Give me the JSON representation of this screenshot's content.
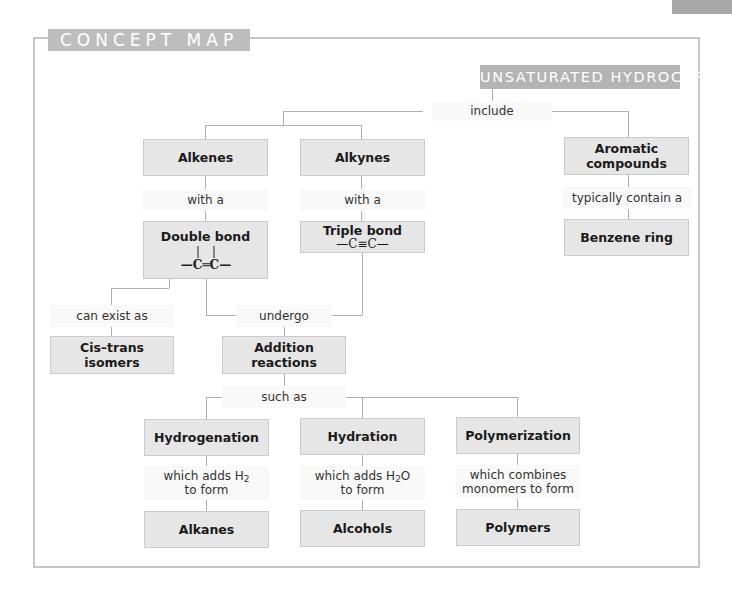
{
  "header": {
    "frame_title": "CONCEPT MAP"
  },
  "root": {
    "label": "UNSATURATED HYDROCARBONS"
  },
  "links": {
    "include": "include",
    "alkenes_with": "with a",
    "alkynes_with": "with a",
    "aromatic_contain": "typically contain a",
    "can_exist_as": "can exist as",
    "undergo": "undergo",
    "such_as": "such as",
    "hydrogenation_adds": "which adds H",
    "hydrogenation_sub": "2",
    "hydrogenation_to_form": "to form",
    "hydration_adds": "which adds H",
    "hydration_sub": "2",
    "hydration_tail": "O",
    "hydration_to_form": "to form",
    "polymerization_combines": "which combines",
    "polymerization_to_form": "monomers to form"
  },
  "nodes": {
    "alkenes": "Alkenes",
    "alkynes": "Alkynes",
    "aromatic_line1": "Aromatic",
    "aromatic_line2": "compounds",
    "double_bond": "Double bond",
    "double_bond_formula": "—C═C—",
    "triple_bond": "Triple bond",
    "triple_bond_formula": "—C≡C—",
    "benzene_ring": "Benzene ring",
    "cis_trans_line1": "Cis–trans",
    "cis_trans_line2": "isomers",
    "addition_line1": "Addition",
    "addition_line2": "reactions",
    "hydrogenation": "Hydrogenation",
    "hydration": "Hydration",
    "polymerization": "Polymerization",
    "alkanes": "Alkanes",
    "alcohols": "Alcohols",
    "polymers": "Polymers"
  },
  "colors": {
    "node_fill": "#e6e6e6",
    "title_fill": "#bdbdbd",
    "root_fill": "#b4b4b4",
    "connector": "#b0b0b0",
    "frame_border": "#c6c6c6"
  }
}
